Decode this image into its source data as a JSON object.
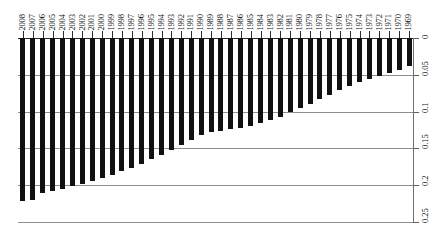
{
  "chart_data": {
    "type": "bar",
    "title": "",
    "subtitle": "",
    "xlabel": "",
    "ylabel": "",
    "orientation": "vertical-inverted",
    "grid": true,
    "legend": null,
    "legend_position": "none",
    "ylim": [
      0,
      0.25
    ],
    "y_axis_position": "right",
    "y_axis_direction": "downward",
    "y_ticks": [
      0,
      0.05,
      0.1,
      0.15,
      0.2,
      0.25
    ],
    "y_tick_labels": [
      "0",
      "0.05",
      "0.1",
      "0.15",
      "0.2",
      "0.25"
    ],
    "x_axis_position": "top",
    "x_tick_label_rotation": 90,
    "bar_color": "#111111",
    "grid_color": "#8e8e8e",
    "axis_color": "#2b2b2b",
    "categories": [
      "2008",
      "2007",
      "2006",
      "2005",
      "2004",
      "2003",
      "2002",
      "2001",
      "2000",
      "1999",
      "1998",
      "1997",
      "1996",
      "1995",
      "1994",
      "1993",
      "1992",
      "1991",
      "1990",
      "1989",
      "1988",
      "1987",
      "1986",
      "1985",
      "1984",
      "1983",
      "1982",
      "1981",
      "1980",
      "1979",
      "1978",
      "1977",
      "1976",
      "1975",
      "1974",
      "1973",
      "1972",
      "1971",
      "1970",
      "1969"
    ],
    "values": [
      0.221,
      0.22,
      0.21,
      0.208,
      0.205,
      0.201,
      0.198,
      0.194,
      0.19,
      0.186,
      0.181,
      0.176,
      0.171,
      0.165,
      0.159,
      0.152,
      0.145,
      0.138,
      0.132,
      0.128,
      0.126,
      0.124,
      0.122,
      0.12,
      0.116,
      0.112,
      0.107,
      0.101,
      0.095,
      0.089,
      0.083,
      0.077,
      0.071,
      0.065,
      0.06,
      0.056,
      0.052,
      0.047,
      0.043,
      0.038
    ]
  }
}
